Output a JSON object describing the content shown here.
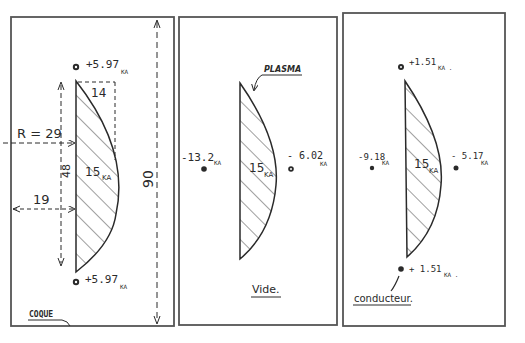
{
  "panels": [
    {
      "id": "coque",
      "caption": "COQUE",
      "plasma_current": "15",
      "plasma_unit": "KA",
      "top_conductor": {
        "value": "+5.97",
        "unit": "KA"
      },
      "bottom_conductor": {
        "value": "+5.97",
        "unit": "KA"
      },
      "dimensions": {
        "radius": "R = 29",
        "width": "14",
        "height": "48",
        "offset": "19",
        "total_height": "90"
      }
    },
    {
      "id": "vide",
      "caption": "Vide.",
      "plasma_label": "PLASMA",
      "plasma_current": "15",
      "plasma_unit": "KA",
      "left_conductor": {
        "value": "-13.2",
        "unit": "KA"
      },
      "right_conductor": {
        "value": "- 6.02",
        "unit": "KA"
      }
    },
    {
      "id": "conducteur",
      "caption": "conducteur.",
      "plasma_current": "15",
      "plasma_unit": "KA",
      "top_conductor": {
        "value": "+1.51",
        "unit": "KA ."
      },
      "bottom_conductor": {
        "value": "+ 1.51",
        "unit": "KA ."
      },
      "left_conductor": {
        "value": "-9.18",
        "unit": "KA"
      },
      "right_conductor": {
        "value": "- 5.17",
        "unit": "KA"
      }
    }
  ],
  "colors": {
    "ink": "#2a2a2a",
    "paper": "#ffffff",
    "border": "#555555"
  }
}
